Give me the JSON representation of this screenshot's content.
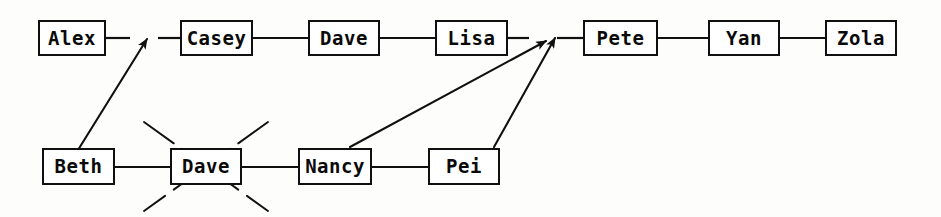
{
  "diagram": {
    "type": "linked-list-node-diagram",
    "title": "",
    "background_color": "#fdfdfb",
    "ink_color": "#101010",
    "rows": [
      {
        "name": "top-row",
        "nodes": [
          {
            "id": "alex",
            "label": "Alex",
            "x": 38,
            "y": 20,
            "w": 68,
            "h": 36,
            "crossed_out": false
          },
          {
            "id": "casey",
            "label": "Casey",
            "x": 180,
            "y": 20,
            "w": 73,
            "h": 36,
            "crossed_out": false
          },
          {
            "id": "dave_top",
            "label": "Dave",
            "x": 308,
            "y": 20,
            "w": 72,
            "h": 36,
            "crossed_out": false
          },
          {
            "id": "lisa",
            "label": "Lisa",
            "x": 435,
            "y": 20,
            "w": 73,
            "h": 36,
            "crossed_out": false
          },
          {
            "id": "pete",
            "label": "Pete",
            "x": 583,
            "y": 20,
            "w": 75,
            "h": 36,
            "crossed_out": false
          },
          {
            "id": "yan",
            "label": "Yan",
            "x": 708,
            "y": 20,
            "w": 72,
            "h": 36,
            "crossed_out": false
          },
          {
            "id": "zola",
            "label": "Zola",
            "x": 825,
            "y": 20,
            "w": 72,
            "h": 36,
            "crossed_out": false
          }
        ]
      },
      {
        "name": "bottom-row",
        "nodes": [
          {
            "id": "beth",
            "label": "Beth",
            "x": 42,
            "y": 148,
            "w": 73,
            "h": 37,
            "crossed_out": false
          },
          {
            "id": "dave_bottom",
            "label": "Dave",
            "x": 170,
            "y": 148,
            "w": 72,
            "h": 37,
            "crossed_out": true
          },
          {
            "id": "nancy",
            "label": "Nancy",
            "x": 298,
            "y": 148,
            "w": 74,
            "h": 37,
            "crossed_out": false
          },
          {
            "id": "pei",
            "label": "Pei",
            "x": 428,
            "y": 148,
            "w": 72,
            "h": 37,
            "crossed_out": false
          }
        ]
      }
    ],
    "connectors": [
      {
        "id": "alex-to-gap",
        "from": "alex",
        "to": "gap-alex-casey",
        "x1": 106,
        "y1": 38,
        "x2": 130,
        "y2": 38
      },
      {
        "id": "gap-to-casey",
        "from": "gap-alex-casey",
        "to": "casey",
        "x1": 158,
        "y1": 38,
        "x2": 180,
        "y2": 38
      },
      {
        "id": "casey-to-dave",
        "from": "casey",
        "to": "dave_top",
        "x1": 253,
        "y1": 38,
        "x2": 308,
        "y2": 38
      },
      {
        "id": "dave-to-lisa",
        "from": "dave_top",
        "to": "lisa",
        "x1": 380,
        "y1": 38,
        "x2": 435,
        "y2": 38
      },
      {
        "id": "lisa-to-gap",
        "from": "lisa",
        "to": "gap-lisa-pete",
        "x1": 508,
        "y1": 38,
        "x2": 529,
        "y2": 38
      },
      {
        "id": "gap-to-pete",
        "from": "gap-lisa-pete",
        "to": "pete",
        "x1": 557,
        "y1": 38,
        "x2": 583,
        "y2": 38
      },
      {
        "id": "pete-to-yan",
        "from": "pete",
        "to": "yan",
        "x1": 658,
        "y1": 38,
        "x2": 708,
        "y2": 38
      },
      {
        "id": "yan-to-zola",
        "from": "yan",
        "to": "zola",
        "x1": 780,
        "y1": 38,
        "x2": 825,
        "y2": 38
      },
      {
        "id": "beth-to-dave",
        "from": "beth",
        "to": "dave_bottom",
        "x1": 115,
        "y1": 167,
        "x2": 170,
        "y2": 167
      },
      {
        "id": "dave-to-nancy",
        "from": "dave_bottom",
        "to": "nancy",
        "x1": 242,
        "y1": 167,
        "x2": 298,
        "y2": 167
      },
      {
        "id": "nancy-to-pei",
        "from": "nancy",
        "to": "pei",
        "x1": 372,
        "y1": 167,
        "x2": 428,
        "y2": 167
      }
    ],
    "arrows": [
      {
        "id": "beth-to-alex-casey-gap",
        "from": "beth",
        "to": "gap-alex-casey",
        "x1": 78,
        "y1": 150,
        "x2": 147,
        "y2": 39
      },
      {
        "id": "nancy-to-lisa-pete-gap",
        "from": "nancy",
        "to": "gap-lisa-pete",
        "x1": 350,
        "y1": 147,
        "x2": 546,
        "y2": 41
      },
      {
        "id": "pei-to-lisa-pete-gap",
        "from": "pei",
        "to": "gap-lisa-pete",
        "x1": 494,
        "y1": 147,
        "x2": 555,
        "y2": 38
      }
    ],
    "annotations": [
      {
        "id": "dave-bottom-crossout",
        "target": "dave_bottom",
        "kind": "x-cross-out",
        "meaning": "deleted node"
      }
    ]
  }
}
